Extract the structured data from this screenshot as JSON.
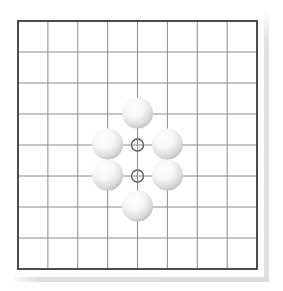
{
  "board": {
    "cols": 9,
    "rows": 9,
    "origin_x": 18,
    "origin_y": 21,
    "spacing_x": 29.875,
    "spacing_y": 31,
    "border_color": "#3a3a3a",
    "line_color": "#8a8a8a",
    "background": "#ffffff"
  },
  "stones": [
    {
      "color": "white",
      "col": 4,
      "row": 3
    },
    {
      "color": "white",
      "col": 3,
      "row": 4
    },
    {
      "color": "white",
      "col": 5,
      "row": 4
    },
    {
      "color": "white",
      "col": 3,
      "row": 5
    },
    {
      "color": "white",
      "col": 5,
      "row": 5
    },
    {
      "color": "white",
      "col": 4,
      "row": 6
    }
  ],
  "markers": [
    {
      "type": "circle",
      "col": 4,
      "row": 4
    },
    {
      "type": "circle",
      "col": 4,
      "row": 5
    }
  ],
  "stone_radius": 15.5,
  "marker_radius": 6
}
